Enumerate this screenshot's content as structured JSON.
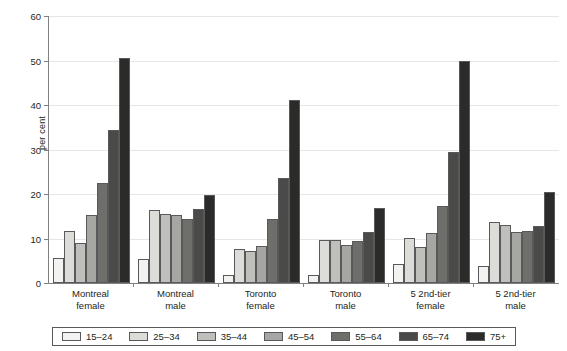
{
  "chart_data": {
    "type": "bar",
    "title": "",
    "subtitle": "",
    "xlabel": "",
    "ylabel": "per cent",
    "ylim": [
      0,
      60
    ],
    "yticks": [
      0,
      10,
      20,
      30,
      40,
      50,
      60
    ],
    "grid": true,
    "legend_position": "bottom",
    "categories": [
      "Montreal female",
      "Montreal male",
      "Toronto female",
      "Toronto male",
      "5 2nd-tier female",
      "5 2nd-tier male"
    ],
    "category_lines": [
      [
        "Montreal",
        "female"
      ],
      [
        "Montreal",
        "male"
      ],
      [
        "Toronto",
        "female"
      ],
      [
        "Toronto",
        "male"
      ],
      [
        "5 2nd-tier",
        "female"
      ],
      [
        "5 2nd-tier",
        "male"
      ]
    ],
    "series": [
      {
        "name": "15–24",
        "color": "#f2f2f0",
        "values": [
          5.6,
          5.3,
          1.8,
          1.7,
          4.2,
          3.8
        ]
      },
      {
        "name": "25–34",
        "color": "#dcdcd8",
        "values": [
          11.8,
          16.3,
          7.6,
          9.7,
          10.1,
          13.8
        ]
      },
      {
        "name": "35–44",
        "color": "#bfbfbb",
        "values": [
          9.0,
          15.5,
          7.2,
          9.6,
          8.0,
          13.0
        ]
      },
      {
        "name": "45–54",
        "color": "#a6a6a2",
        "values": [
          15.2,
          15.2,
          8.3,
          8.6,
          11.3,
          11.4
        ]
      },
      {
        "name": "55–64",
        "color": "#6e6e6b",
        "values": [
          22.4,
          14.3,
          14.3,
          9.4,
          17.3,
          11.7
        ]
      },
      {
        "name": "65–74",
        "color": "#4a4a48",
        "values": [
          34.3,
          16.6,
          23.5,
          11.4,
          29.4,
          12.9
        ]
      },
      {
        "name": "75+",
        "color": "#2b2b29",
        "values": [
          50.6,
          19.8,
          41.2,
          16.8,
          49.8,
          20.4
        ]
      }
    ]
  }
}
